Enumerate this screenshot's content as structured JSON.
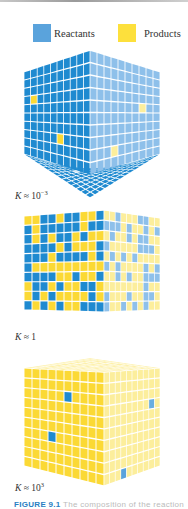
{
  "legend": {
    "reactants_label": "Reactants",
    "products_label": "Products",
    "reactants_color": "#5aa3dc",
    "products_color": "#fde03c"
  },
  "colors": {
    "blue_front": "#1f8ad0",
    "blue_side": "#8ec0ea",
    "yellow_front": "#fbd935",
    "yellow_side": "#fcee9c",
    "grid_line": "#ffffff"
  },
  "panels": [
    {
      "id": "low-k",
      "k_symbol": "K",
      "k_relation": "≈",
      "k_base": "10",
      "k_exponent": "−3",
      "description": "Almost all reactants; view from below"
    },
    {
      "id": "mid-k",
      "k_symbol": "K",
      "k_relation": "≈",
      "k_base": "1",
      "k_exponent": "",
      "description": "Comparable amounts of reactants and products"
    },
    {
      "id": "high-k",
      "k_symbol": "K",
      "k_relation": "≈",
      "k_base": "10",
      "k_exponent": "3",
      "description": "Almost all products; view from above"
    }
  ],
  "caption": {
    "label": "FIGURE 9.1",
    "text": "The composition of the reaction"
  }
}
